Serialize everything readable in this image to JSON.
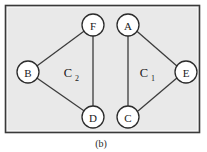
{
  "figure": {
    "caption": "(b)",
    "panel": {
      "fill_color": "#e9e9e9",
      "border_color": "#3a3a3a",
      "x": 5,
      "y": 5,
      "width": 195,
      "height": 128
    },
    "nodes": [
      {
        "id": "F",
        "label": "F",
        "cx": 93,
        "cy": 25,
        "r": 11
      },
      {
        "id": "A",
        "label": "A",
        "cx": 128,
        "cy": 25,
        "r": 11
      },
      {
        "id": "B",
        "label": "B",
        "cx": 28,
        "cy": 72,
        "r": 11
      },
      {
        "id": "E",
        "label": "E",
        "cx": 186,
        "cy": 72,
        "r": 11
      },
      {
        "id": "D",
        "label": "D",
        "cx": 93,
        "cy": 117,
        "r": 11
      },
      {
        "id": "C",
        "label": "C",
        "cx": 128,
        "cy": 117,
        "r": 11
      }
    ],
    "edges": [
      {
        "id": "B-F",
        "from": "B",
        "to": "F"
      },
      {
        "id": "F-D",
        "from": "F",
        "to": "D"
      },
      {
        "id": "B-D",
        "from": "B",
        "to": "D"
      },
      {
        "id": "A-E",
        "from": "A",
        "to": "E"
      },
      {
        "id": "E-C",
        "from": "E",
        "to": "C"
      },
      {
        "id": "A-C",
        "from": "A",
        "to": "C"
      }
    ],
    "cycle_labels": [
      {
        "id": "C2",
        "base": "C",
        "subscript": "2",
        "x": 70,
        "y": 77,
        "members": [
          "B",
          "F",
          "D"
        ]
      },
      {
        "id": "C1",
        "base": "C",
        "subscript": "1",
        "x": 146,
        "y": 77,
        "members": [
          "A",
          "E",
          "C"
        ]
      }
    ],
    "node_style": {
      "fill_color": "#ffffff",
      "stroke_color": "#2b2b2b"
    },
    "edge_style": {
      "stroke_color": "#3c3c3c"
    }
  }
}
